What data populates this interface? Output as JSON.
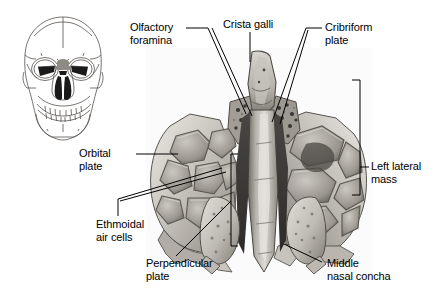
{
  "figure": {
    "background_color": "#ffffff",
    "text_color": "#000000",
    "leader_color": "#000000"
  },
  "inset": {
    "name": "anterior-skull-orientation-drawing",
    "description": "Anterior view line drawing of a human skull with the ethmoid region shaded dark",
    "outline_color": "#4a4a4a",
    "highlight_color": "#111111"
  },
  "specimen": {
    "name": "ethmoid-bone-photograph",
    "description": "Grayscale photograph of an isolated ethmoid bone viewed from above",
    "tone_light": "#e8e6e2",
    "tone_mid": "#9a968f",
    "tone_dark": "#3f3d3a"
  },
  "labels": [
    {
      "id": "olfactory-foramina",
      "text": "Olfactory\nforamina",
      "x": 130,
      "y": 21
    },
    {
      "id": "crista-galli",
      "text": "Crista galli",
      "x": 223,
      "y": 18
    },
    {
      "id": "cribriform-plate",
      "text": "Cribriform\nplate",
      "x": 325,
      "y": 21
    },
    {
      "id": "orbital-plate",
      "text": "Orbital\nplate",
      "x": 79,
      "y": 147
    },
    {
      "id": "left-lateral-mass",
      "text": "Left lateral\nmass",
      "x": 371,
      "y": 160
    },
    {
      "id": "ethmoidal-air-cells",
      "text": "Ethmoidal\nair cells",
      "x": 96,
      "y": 218
    },
    {
      "id": "perpendicular-plate",
      "text": "Perpendicular\nplate",
      "x": 146,
      "y": 257
    },
    {
      "id": "middle-nasal-concha",
      "text": "Middle\nnasal concha",
      "x": 327,
      "y": 257
    }
  ]
}
